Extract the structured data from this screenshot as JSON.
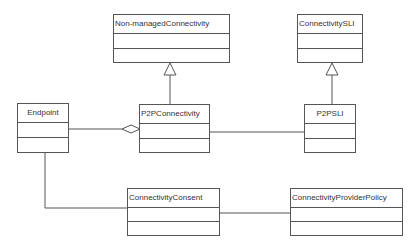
{
  "diagram": {
    "type": "UML class diagram",
    "classes": [
      {
        "id": "nonmanaged",
        "name": "Non-managedConnectivity"
      },
      {
        "id": "connsli",
        "name": "ConnectivitySLI"
      },
      {
        "id": "endpoint",
        "name": "Endpoint"
      },
      {
        "id": "p2pconn",
        "name": "P2PConnectivity"
      },
      {
        "id": "p2psli",
        "name": "P2PSLI"
      },
      {
        "id": "consent",
        "name": "ConnectivityConsent"
      },
      {
        "id": "policy",
        "name": "ConnectivityProviderPolicy"
      }
    ],
    "relationships": [
      {
        "from": "P2PConnectivity",
        "to": "Non-managedConnectivity",
        "type": "generalization"
      },
      {
        "from": "P2PSLI",
        "to": "ConnectivitySLI",
        "type": "generalization"
      },
      {
        "from": "Endpoint",
        "to": "P2PConnectivity",
        "type": "aggregation"
      },
      {
        "from": "P2PConnectivity",
        "to": "P2PSLI",
        "type": "association"
      },
      {
        "from": "Endpoint",
        "to": "ConnectivityConsent",
        "type": "association"
      },
      {
        "from": "ConnectivityConsent",
        "to": "ConnectivityProviderPolicy",
        "type": "association"
      }
    ],
    "colors": {
      "line": "#555555",
      "text": "#333333",
      "background": "#ffffff"
    }
  }
}
